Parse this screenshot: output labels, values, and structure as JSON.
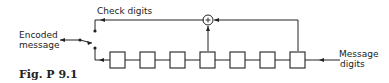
{
  "labels": {
    "check_digits": "Check digits",
    "encoded_message_line1": "Encoded",
    "encoded_message_line2": "message",
    "message_digits_line1": "Message",
    "message_digits_line2": "digits",
    "adder_symbol": "+",
    "figure_caption": "Fig. P 9.1"
  },
  "diagram": {
    "shift_register_stages": 7,
    "adder_inputs": [
      "stage 4",
      "stage 7"
    ],
    "colors": {
      "stroke": "#222222",
      "background": "#ffffff"
    }
  }
}
